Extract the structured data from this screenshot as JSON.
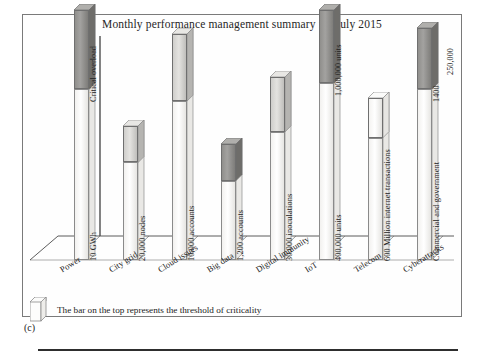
{
  "figure": {
    "caption": "(c)",
    "title": "Monthly performance management summary for July 2015"
  },
  "legend": {
    "text": "The bar on the top represents the threshold of criticality",
    "swatch_name": "threshold-bar-swatch"
  },
  "axis": {
    "threshold_annotation": "Critical overload"
  },
  "chart_data": {
    "type": "bar",
    "title": "Monthly performance management summary for July 2015",
    "xlabel": "",
    "ylabel": "",
    "grid": false,
    "legend_position": "bottom-left",
    "note": "Each column is a 3D bar; the shaded block on top of each bar marks the threshold of criticality. Values are qualitative magnitudes read from bar heights (0-100 scale of plot area).",
    "categories": [
      "Power",
      "City grid",
      "Cloud issues",
      "Big data",
      "Digital immunity",
      "IoT",
      "Telecom",
      "Cyberattacks"
    ],
    "value_labels": [
      "10 GWh",
      "20,000 nodes",
      "10,000 accounts",
      "1,200 accounts",
      "30,000 inoculations",
      "400,000 units",
      "600 Million internet transactions",
      "Commercial and government"
    ],
    "threshold_labels": [
      "Critical overload",
      "",
      "",
      "",
      "",
      "1,000,000 units",
      "",
      "1400"
    ],
    "extra_labels": [
      "250,000"
    ],
    "series": [
      {
        "name": "Measured value",
        "values": [
          56,
          32,
          52,
          26,
          42,
          58,
          40,
          56
        ]
      },
      {
        "name": "Threshold of criticality",
        "values": [
          26,
          12,
          22,
          12,
          18,
          24,
          13,
          20
        ]
      }
    ],
    "bars": [
      {
        "category": "Power",
        "value_label": "10 GWh",
        "threshold_label": "Critical overload",
        "body_height": 56,
        "cap_height": 26,
        "cap_style": "critical"
      },
      {
        "category": "City grid",
        "value_label": "20,000 nodes",
        "threshold_label": "",
        "body_height": 32,
        "cap_height": 12,
        "cap_style": "sub"
      },
      {
        "category": "Cloud issues",
        "value_label": "10,000 accounts",
        "threshold_label": "",
        "body_height": 52,
        "cap_height": 22,
        "cap_style": "sub"
      },
      {
        "category": "Big data",
        "value_label": "1,200 accounts",
        "threshold_label": "",
        "body_height": 26,
        "cap_height": 12,
        "cap_style": "critical"
      },
      {
        "category": "Digital immunity",
        "value_label": "30,000 inoculations",
        "threshold_label": "",
        "body_height": 42,
        "cap_height": 18,
        "cap_style": "sub"
      },
      {
        "category": "IoT",
        "value_label": "400,000 units",
        "threshold_label": "1,000,000 units",
        "body_height": 58,
        "cap_height": 24,
        "cap_style": "critical"
      },
      {
        "category": "Telecom",
        "value_label": "600 Million internet transactions",
        "threshold_label": "",
        "body_height": 40,
        "cap_height": 13,
        "cap_style": "clear"
      },
      {
        "category": "Cyberattacks",
        "value_label": "Commercial and government",
        "threshold_label": "1400",
        "secondary_label": "250,000",
        "body_height": 56,
        "cap_height": 20,
        "cap_style": "critical"
      }
    ]
  }
}
